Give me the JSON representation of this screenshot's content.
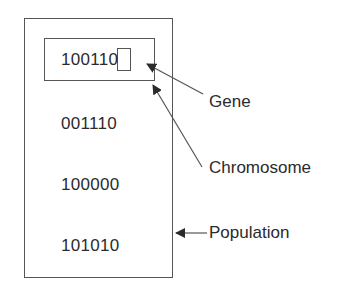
{
  "diagram": {
    "type": "genetic-algorithm-population",
    "population": {
      "chromosomes": [
        {
          "bits": "100110",
          "highlighted": true
        },
        {
          "bits": "001110"
        },
        {
          "bits": "100000"
        },
        {
          "bits": "101010"
        }
      ]
    },
    "highlighted_chromosome": {
      "prefix": "10011",
      "gene": "0"
    },
    "labels": {
      "gene": "Gene",
      "chromosome": "Chromosome",
      "population": "Population"
    },
    "colors": {
      "stroke": "#555555",
      "text": "#2b2b2b",
      "background": "#ffffff"
    }
  }
}
